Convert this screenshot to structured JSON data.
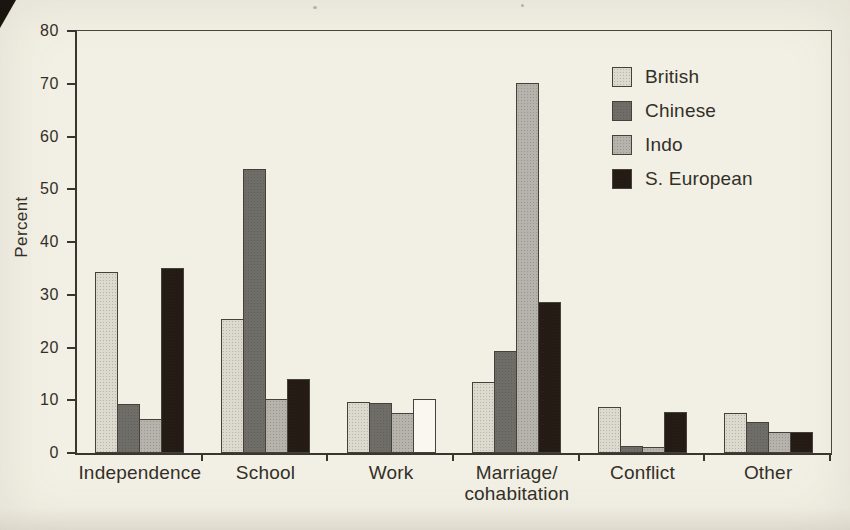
{
  "page": {
    "background": "#f2efe4",
    "text_color": "#332f28",
    "axis_color": "#3a362f"
  },
  "chart_data": {
    "type": "bar",
    "ylabel": "Percent",
    "ylim": [
      0,
      80
    ],
    "ytick_step": 10,
    "ytick_labels": [
      "0",
      "10",
      "20",
      "30",
      "40",
      "50",
      "60",
      "70",
      "80"
    ],
    "grid": false,
    "legend_position": "top-right",
    "categories": [
      "Independence",
      "School",
      "Work",
      "Marriage/\ncohabitation",
      "Conflict",
      "Other"
    ],
    "series": [
      {
        "name": "British",
        "color": "#dcd9cf",
        "values": [
          34.3,
          25.5,
          9.6,
          13.4,
          8.8,
          7.6
        ]
      },
      {
        "name": "Chinese",
        "color": "#6f6d67",
        "values": [
          9.3,
          53.8,
          9.4,
          19.4,
          1.4,
          5.9
        ]
      },
      {
        "name": "Indo",
        "color": "#b5b3ab",
        "values": [
          6.4,
          10.3,
          7.5,
          70.1,
          1.2,
          4.0
        ]
      },
      {
        "name": "S. European",
        "color": "#241b15",
        "values": [
          35.1,
          14.0,
          10.2,
          28.7,
          7.7,
          4.0
        ]
      }
    ],
    "bar_fill_exceptions": [
      {
        "category": "Work",
        "series": "S. European",
        "fill": "#f9f7ef"
      }
    ]
  }
}
